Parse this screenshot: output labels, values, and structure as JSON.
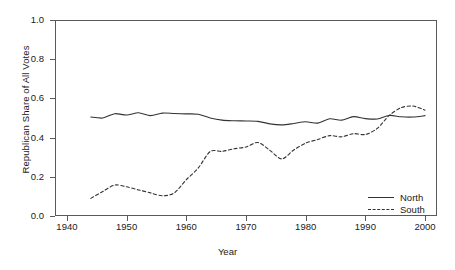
{
  "figure": {
    "title_clipped": "",
    "background": "#ffffff",
    "frame_color": "#5a5a5a"
  },
  "chart_data": {
    "type": "line",
    "title": "",
    "xlabel": "Year",
    "ylabel": "Republican Share of All Votes",
    "xlim": [
      1938,
      2002
    ],
    "ylim": [
      0.0,
      1.0
    ],
    "grid": false,
    "legend_position": "bottom-right",
    "x_ticks": [
      1940,
      1950,
      1960,
      1970,
      1980,
      1990,
      2000
    ],
    "y_ticks": [
      0.0,
      0.2,
      0.4,
      0.6,
      0.8,
      1.0
    ],
    "x_tick_labels": [
      "1940",
      "1950",
      "1960",
      "1970",
      "1980",
      "1990",
      "2000"
    ],
    "y_tick_labels": [
      "0.0",
      "0.2",
      "0.4",
      "0.6",
      "0.8",
      "1.0"
    ],
    "x": [
      1944,
      1946,
      1948,
      1950,
      1952,
      1954,
      1956,
      1958,
      1960,
      1962,
      1964,
      1966,
      1968,
      1970,
      1972,
      1974,
      1976,
      1978,
      1980,
      1982,
      1984,
      1986,
      1988,
      1990,
      1992,
      1994,
      1996,
      1998,
      2000
    ],
    "series": [
      {
        "name": "North",
        "style": "solid",
        "color": "#333333",
        "values": [
          0.505,
          0.5,
          0.522,
          0.515,
          0.527,
          0.512,
          0.525,
          0.523,
          0.521,
          0.519,
          0.5,
          0.489,
          0.486,
          0.485,
          0.483,
          0.47,
          0.465,
          0.472,
          0.481,
          0.474,
          0.496,
          0.489,
          0.507,
          0.497,
          0.495,
          0.513,
          0.506,
          0.505,
          0.512
        ]
      },
      {
        "name": "South",
        "style": "dashed",
        "color": "#333333",
        "values": [
          0.09,
          0.125,
          0.158,
          0.149,
          0.133,
          0.118,
          0.103,
          0.118,
          0.185,
          0.245,
          0.329,
          0.33,
          0.343,
          0.352,
          0.375,
          0.335,
          0.291,
          0.337,
          0.372,
          0.39,
          0.41,
          0.404,
          0.42,
          0.416,
          0.447,
          0.513,
          0.553,
          0.561,
          0.54
        ]
      }
    ]
  },
  "legend": {
    "entries": [
      {
        "label": "North",
        "style": "solid"
      },
      {
        "label": "South",
        "style": "dashed"
      }
    ]
  }
}
